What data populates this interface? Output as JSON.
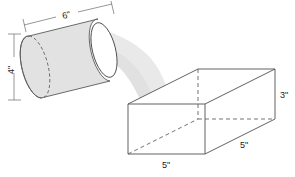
{
  "figure": {
    "background_color": "#ffffff",
    "stroke_color": "#4a4a4a",
    "solid_fill": "#e2e2e2",
    "stream_fill": "#e8e8e8",
    "label_color": "#1a1a1a"
  },
  "cylinder": {
    "name": "cylinder",
    "fill": "#e2e2e2",
    "near_end_fill": "#ffffff",
    "dimensions": {
      "length_label": "6\"",
      "diameter_label": "4\""
    }
  },
  "prism": {
    "name": "rectangular-prism",
    "fill": "#ffffff",
    "dimensions": {
      "height_label": "3\"",
      "width_label": "5\"",
      "depth_label": "5\""
    }
  },
  "stream": {
    "name": "pour-stream",
    "fill": "#e8e8e8"
  },
  "labels": {
    "cylinder_length": "6\"",
    "cylinder_diameter": "4\"",
    "prism_height": "3\"",
    "prism_front_width": "5\"",
    "prism_side_depth": "5\""
  }
}
